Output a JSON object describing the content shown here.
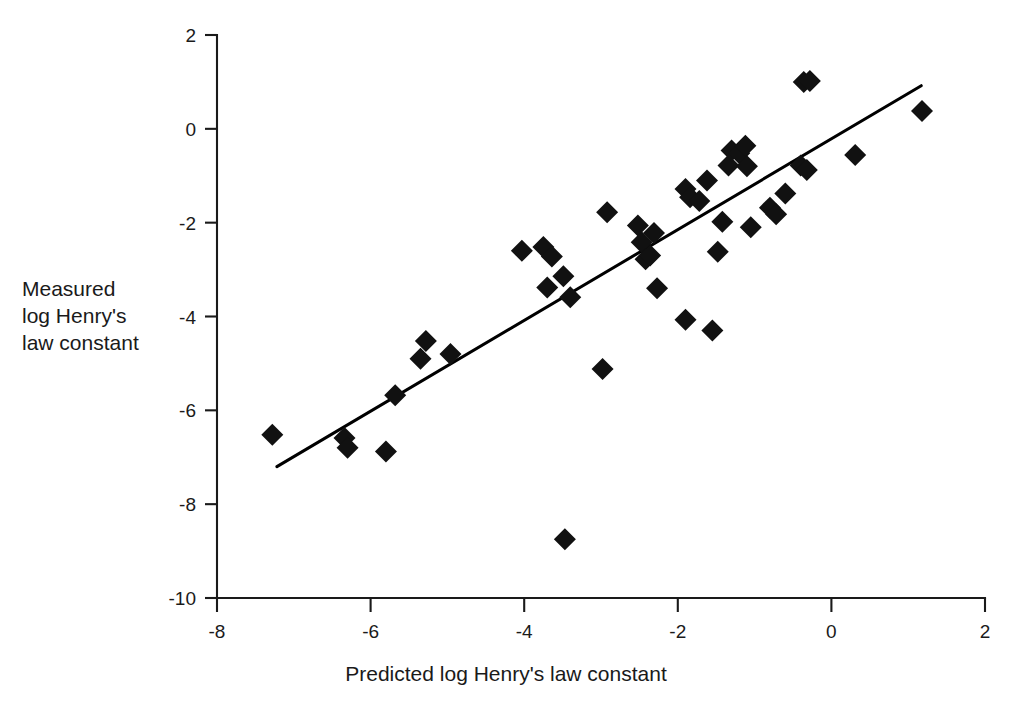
{
  "chart_data": {
    "type": "scatter",
    "title": "",
    "xlabel": "Predicted log Henry's law constant",
    "ylabel": "Measured\nlog Henry's\nlaw constant",
    "xlim": [
      -8,
      2
    ],
    "ylim": [
      -10,
      2
    ],
    "xticks": [
      -8,
      -6,
      -4,
      -2,
      0,
      2
    ],
    "xticklabels": [
      "-8",
      "-6",
      "-4",
      "-2",
      "0",
      "2"
    ],
    "yticks": [
      2,
      0,
      -2,
      -4,
      -6,
      -8,
      -10
    ],
    "yticklabels": [
      "2",
      "0",
      "-2",
      "-4",
      "-6",
      "-8",
      "-10"
    ],
    "grid": false,
    "legend": null,
    "marker": "diamond",
    "marker_color": "#111111",
    "marker_size": 11,
    "series": [
      {
        "name": "Measured vs predicted log Henry's law constant",
        "points": [
          [
            -7.28,
            -6.52
          ],
          [
            -6.34,
            -6.59
          ],
          [
            -6.3,
            -6.8
          ],
          [
            -5.8,
            -6.88
          ],
          [
            -5.68,
            -5.68
          ],
          [
            -5.28,
            -4.52
          ],
          [
            -5.35,
            -4.9
          ],
          [
            -4.96,
            -4.8
          ],
          [
            -4.03,
            -2.6
          ],
          [
            -3.75,
            -2.52
          ],
          [
            -3.64,
            -2.72
          ],
          [
            -3.7,
            -3.38
          ],
          [
            -3.49,
            -3.14
          ],
          [
            -3.47,
            -8.75
          ],
          [
            -3.4,
            -3.59
          ],
          [
            -2.98,
            -5.12
          ],
          [
            -2.92,
            -1.78
          ],
          [
            -2.52,
            -2.06
          ],
          [
            -2.47,
            -2.42
          ],
          [
            -2.42,
            -2.78
          ],
          [
            -2.36,
            -2.7
          ],
          [
            -2.31,
            -2.22
          ],
          [
            -2.27,
            -3.4
          ],
          [
            -1.9,
            -1.28
          ],
          [
            -1.84,
            -1.46
          ],
          [
            -1.9,
            -4.07
          ],
          [
            -1.72,
            -1.54
          ],
          [
            -1.62,
            -1.1
          ],
          [
            -1.55,
            -4.3
          ],
          [
            -1.48,
            -2.62
          ],
          [
            -1.42,
            -1.98
          ],
          [
            -1.34,
            -0.78
          ],
          [
            -1.3,
            -0.46
          ],
          [
            -1.2,
            -0.52
          ],
          [
            -1.12,
            -0.36
          ],
          [
            -1.1,
            -0.8
          ],
          [
            -1.05,
            -2.1
          ],
          [
            -0.8,
            -1.68
          ],
          [
            -0.72,
            -1.82
          ],
          [
            -0.6,
            -1.38
          ],
          [
            -0.4,
            -0.78
          ],
          [
            -0.36,
            1.0
          ],
          [
            -0.28,
            1.02
          ],
          [
            -0.32,
            -0.88
          ],
          [
            0.31,
            -0.56
          ],
          [
            1.18,
            0.38
          ]
        ]
      }
    ],
    "trendline": {
      "label": "regression line",
      "x_start": -7.22,
      "y_start": -7.2,
      "x_end": 1.17,
      "y_end": 0.92
    }
  }
}
